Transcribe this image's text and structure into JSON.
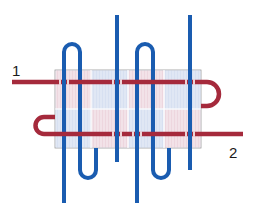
{
  "diagram": {
    "type": "weave-schematic",
    "labels": {
      "thread_start": "1",
      "thread_end": "2"
    },
    "colors": {
      "red_thread": "#A52A3C",
      "blue_thread": "#1A5CB0",
      "grid_fill_blue": "#DCE4F2",
      "grid_fill_pink": "#F0DDE4",
      "grid_border": "#9A9A9A",
      "background": "#FFFFFF"
    },
    "grid": {
      "columns": 4,
      "rows": 2
    }
  }
}
